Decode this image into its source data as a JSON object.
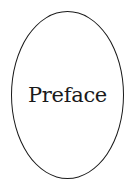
{
  "label": {
    "title": "Preface"
  },
  "colors": {
    "stroke": "#1a1a1a",
    "text": "#1a1a1a",
    "background": "#ffffff"
  }
}
